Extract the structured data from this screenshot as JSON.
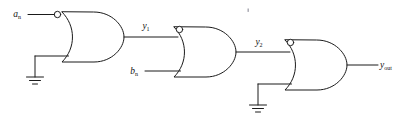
{
  "diagram": {
    "background_color": "#ffffff",
    "line_color": "#1a1a1a"
  },
  "labels": {
    "input_a": {
      "base": "a",
      "sub": "n"
    },
    "input_b": {
      "base": "b",
      "sub": "n"
    },
    "node_y1": {
      "base": "y",
      "sub": "1"
    },
    "node_y2": {
      "base": "y",
      "sub": "2"
    },
    "output_y": {
      "base": "y",
      "sub": "out"
    }
  },
  "gates": [
    {
      "id": "gate-1",
      "type": "or",
      "inverted_input": "top",
      "inputs": [
        "a_n",
        "ground"
      ],
      "output": "y_1"
    },
    {
      "id": "gate-2",
      "type": "or",
      "inverted_input": "top",
      "inputs": [
        "y_1",
        "b_n"
      ],
      "output": "y_2"
    },
    {
      "id": "gate-3",
      "type": "or",
      "inverted_input": "top",
      "inputs": [
        "y_2",
        "ground"
      ],
      "output": "y_out"
    }
  ],
  "grounds": [
    {
      "id": "ground-1",
      "attached_to": "gate-1"
    },
    {
      "id": "ground-2",
      "attached_to": "gate-3"
    }
  ]
}
